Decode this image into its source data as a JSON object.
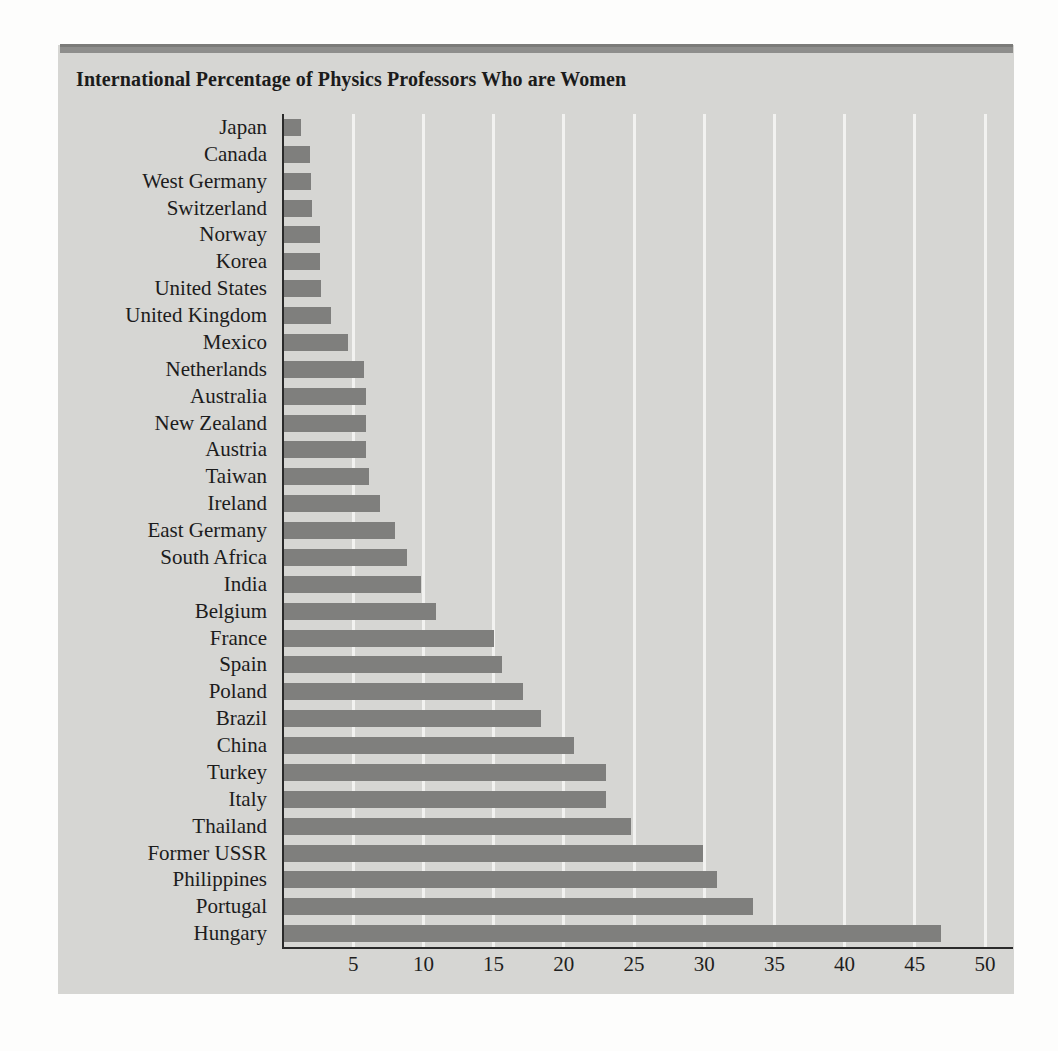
{
  "figure": {
    "title": "International Percentage of Physics Professors Who are Women",
    "bar_color": "#7f7f7d",
    "panel_color": "#d6d6d3",
    "gridline_color": "#f2f2f0",
    "axis_color": "#2a2a2a"
  },
  "chart_data": {
    "type": "bar",
    "orientation": "horizontal",
    "title": "International Percentage of Physics Professors Who are Women",
    "xlabel": "",
    "ylabel": "",
    "xlim": [
      0,
      51
    ],
    "xticks": [
      5,
      10,
      15,
      20,
      25,
      30,
      35,
      40,
      45,
      50
    ],
    "grid": true,
    "legend": false,
    "categories": [
      "Japan",
      "Canada",
      "West Germany",
      "Switzerland",
      "Norway",
      "Korea",
      "United States",
      "United Kingdom",
      "Mexico",
      "Netherlands",
      "Australia",
      "New Zealand",
      "Austria",
      "Taiwan",
      "Ireland",
      "East Germany",
      "South Africa",
      "India",
      "Belgium",
      "France",
      "Spain",
      "Poland",
      "Brazil",
      "China",
      "Turkey",
      "Italy",
      "Thailand",
      "Former USSR",
      "Philippines",
      "Portugal",
      "Hungary"
    ],
    "values": [
      1.3,
      1.9,
      2.0,
      2.1,
      2.6,
      2.6,
      2.7,
      3.4,
      4.6,
      5.8,
      5.9,
      5.9,
      5.9,
      6.1,
      6.9,
      8.0,
      8.8,
      9.8,
      10.9,
      15.0,
      15.6,
      17.1,
      18.4,
      20.7,
      23.0,
      23.0,
      24.8,
      29.9,
      30.9,
      33.5,
      46.9
    ]
  }
}
